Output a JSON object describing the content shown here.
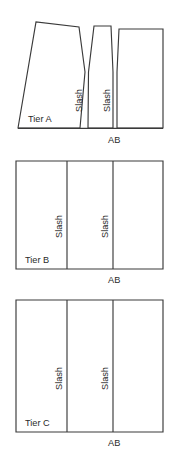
{
  "figure": {
    "background_color": "#ffffff",
    "line_color": "#3a3a3a",
    "text_color": "#2b2b2b"
  },
  "tiers": [
    {
      "id": "tier-a",
      "name": "Tier A",
      "label": "Tier A",
      "shape": "flared-with-wedge-cuts",
      "baseline_label": "AB",
      "slash_labels": [
        "Slash",
        "Slash"
      ]
    },
    {
      "id": "tier-b",
      "name": "Tier B",
      "label": "Tier B",
      "shape": "rectangle",
      "baseline_label": "AB",
      "slash_labels": [
        "Slash",
        "Slash"
      ]
    },
    {
      "id": "tier-c",
      "name": "Tier C",
      "label": "Tier C",
      "shape": "rectangle",
      "baseline_label": "AB",
      "slash_labels": [
        "Slash",
        "Slash"
      ]
    }
  ]
}
